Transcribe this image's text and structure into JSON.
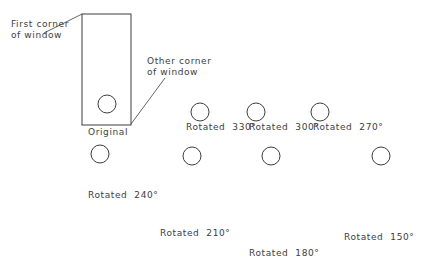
{
  "figure": {
    "title_visible": false,
    "background_color": "#ffffff",
    "stroke_color": "#3d3d3d",
    "text_color": "#3d3d3d",
    "width": 432,
    "height": 275
  },
  "annotations": {
    "first_corner": "First corner\nof window",
    "other_corner": "Other corner\nof window"
  },
  "shapes": [
    {
      "id": "original",
      "label": "Original",
      "label_x": 88,
      "label_y": 127,
      "angle_text": "",
      "circle": {
        "cx": 107,
        "cy": 104,
        "r": 9
      },
      "tip": {
        "x": 107,
        "y": 20
      },
      "head_len": 28,
      "head_half_width": 10,
      "shaft_half_width": 2.2,
      "window_rect": {
        "x": 82,
        "y": 14,
        "w": 49,
        "h": 111
      }
    },
    {
      "id": "rot330",
      "label": "Rotated  330°",
      "label_x": 186,
      "label_y": 122,
      "circle": {
        "cx": 200,
        "cy": 112,
        "r": 9
      },
      "tip": {
        "x": 246,
        "y": 32
      },
      "head_len": 28,
      "head_half_width": 10,
      "shaft_half_width": 2.2
    },
    {
      "id": "rot300",
      "label": "Rotated  300°",
      "label_x": 249,
      "label_y": 122,
      "circle": {
        "cx": 256,
        "cy": 112,
        "r": 9
      },
      "tip": {
        "x": 323,
        "y": 61
      },
      "head_len": 28,
      "head_half_width": 10,
      "shaft_half_width": 2.2
    },
    {
      "id": "rot270",
      "label": "Rotated  270°",
      "label_x": 313,
      "label_y": 122,
      "circle": {
        "cx": 320,
        "cy": 112,
        "r": 9
      },
      "tip": {
        "x": 395,
        "y": 112
      },
      "head_len": 28,
      "head_half_width": 10,
      "shaft_half_width": 2.2
    },
    {
      "id": "rot240",
      "label": "Rotated  240°",
      "label_x": 88,
      "label_y": 190,
      "circle": {
        "cx": 100,
        "cy": 154,
        "r": 9
      },
      "tip": {
        "x": 180,
        "y": 204
      },
      "head_len": 28,
      "head_half_width": 10,
      "shaft_half_width": 2.2
    },
    {
      "id": "rot210",
      "label": "Rotated  210°",
      "label_x": 160,
      "label_y": 228,
      "circle": {
        "cx": 192,
        "cy": 156,
        "r": 9
      },
      "tip": {
        "x": 233,
        "y": 239
      },
      "head_len": 28,
      "head_half_width": 10,
      "shaft_half_width": 2.2
    },
    {
      "id": "rot180",
      "label": "Rotated  180°",
      "label_x": 249,
      "label_y": 248,
      "circle": {
        "cx": 271,
        "cy": 156,
        "r": 9
      },
      "tip": {
        "x": 271,
        "y": 240
      },
      "head_len": 28,
      "head_half_width": 10,
      "shaft_half_width": 2.2
    },
    {
      "id": "rot150",
      "label": "Rotated  150°",
      "label_x": 344,
      "label_y": 232,
      "circle": {
        "cx": 381,
        "cy": 156,
        "r": 9
      },
      "tip": {
        "x": 330,
        "y": 237
      },
      "head_len": 28,
      "head_half_width": 10,
      "shaft_half_width": 2.2
    }
  ],
  "leaders": [
    {
      "id": "leader-first-corner",
      "x1": 44,
      "y1": 33,
      "x2": 82,
      "y2": 14
    },
    {
      "id": "leader-other-corner",
      "x1": 131,
      "y1": 124,
      "x2": 165,
      "y2": 78
    }
  ],
  "label_positions": {
    "first_corner": {
      "x": 11,
      "y": 19
    },
    "other_corner": {
      "x": 147,
      "y": 56
    }
  }
}
